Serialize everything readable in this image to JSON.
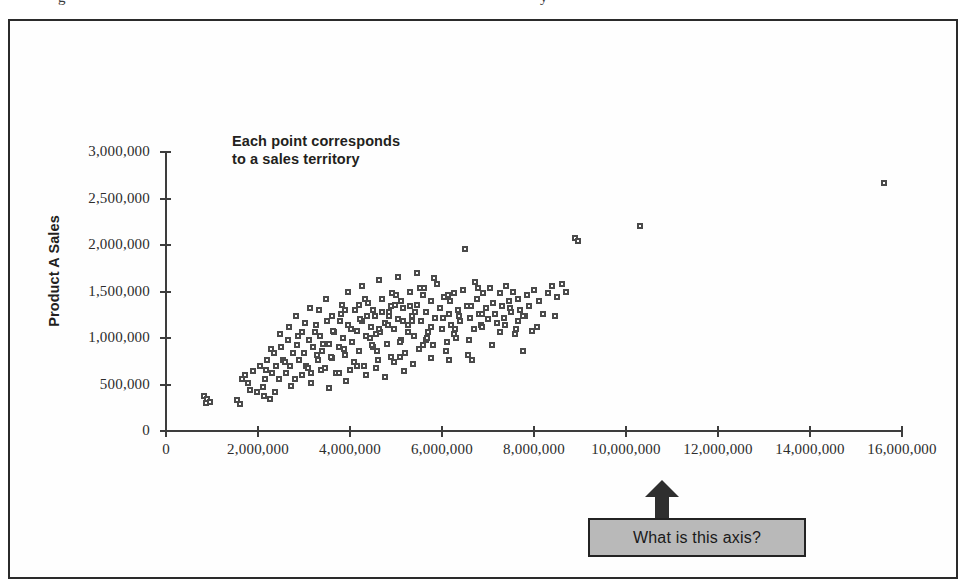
{
  "page": {
    "top_clipped_text_left": "g",
    "top_clipped_text_right": "y"
  },
  "figure": {
    "annotation": {
      "line1": "Each point corresponds",
      "line2": "to a sales territory"
    },
    "callout": {
      "label": "What is this axis?",
      "fill_color": "#b9b9b9",
      "border_color": "#232323",
      "arrow_color": "#2f2f2f"
    }
  },
  "chart_data": {
    "type": "scatter",
    "title": "",
    "xlabel": "",
    "ylabel": "Product A Sales",
    "xlim": [
      0,
      16000000
    ],
    "ylim": [
      0,
      3000000
    ],
    "grid": false,
    "legend": "none",
    "marker_color": "#4a4a4a",
    "annotations": [
      {
        "text": "Each point corresponds to a sales territory",
        "x": 2600000,
        "y": 2950000
      },
      {
        "text": "What is this axis?",
        "x": 11000000,
        "y": -450000
      }
    ],
    "xticks": [
      0,
      2000000,
      4000000,
      6000000,
      8000000,
      10000000,
      12000000,
      14000000,
      16000000
    ],
    "xticklabels": [
      "0",
      "2,000,000",
      "4,000,000",
      "6,000,000",
      "8,000,000",
      "10,000,000",
      "12,000,000",
      "14,000,000",
      "16,000,000"
    ],
    "yticks": [
      0,
      500000,
      1000000,
      1500000,
      2000000,
      2500000,
      3000000
    ],
    "yticklabels": [
      "0",
      "500,000",
      "1,000,000",
      "1,500,000",
      "2,000,000",
      "2,500,000",
      "3,000,000"
    ],
    "points": [
      [
        820000,
        380000
      ],
      [
        900000,
        345000
      ],
      [
        880000,
        300000
      ],
      [
        950000,
        310000
      ],
      [
        1550000,
        330000
      ],
      [
        1600000,
        290000
      ],
      [
        1650000,
        560000
      ],
      [
        1720000,
        600000
      ],
      [
        1780000,
        520000
      ],
      [
        1900000,
        640000
      ],
      [
        2050000,
        700000
      ],
      [
        2100000,
        470000
      ],
      [
        2150000,
        560000
      ],
      [
        2200000,
        760000
      ],
      [
        2300000,
        620000
      ],
      [
        2350000,
        840000
      ],
      [
        2400000,
        700000
      ],
      [
        2450000,
        560000
      ],
      [
        2500000,
        900000
      ],
      [
        2550000,
        760000
      ],
      [
        2600000,
        620000
      ],
      [
        2650000,
        980000
      ],
      [
        2700000,
        700000
      ],
      [
        2750000,
        840000
      ],
      [
        2800000,
        560000
      ],
      [
        2850000,
        920000
      ],
      [
        2900000,
        760000
      ],
      [
        2950000,
        1060000
      ],
      [
        3000000,
        840000
      ],
      [
        3050000,
        700000
      ],
      [
        3100000,
        980000
      ],
      [
        3150000,
        620000
      ],
      [
        3200000,
        900000
      ],
      [
        3250000,
        1140000
      ],
      [
        3300000,
        760000
      ],
      [
        3350000,
        1020000
      ],
      [
        3400000,
        860000
      ],
      [
        3450000,
        680000
      ],
      [
        3500000,
        1180000
      ],
      [
        3550000,
        940000
      ],
      [
        3600000,
        780000
      ],
      [
        3650000,
        1060000
      ],
      [
        3700000,
        620000
      ],
      [
        3750000,
        900000
      ],
      [
        3800000,
        1260000
      ],
      [
        3850000,
        1000000
      ],
      [
        3900000,
        820000
      ],
      [
        3950000,
        1140000
      ],
      [
        4000000,
        660000
      ],
      [
        4050000,
        960000
      ],
      [
        4100000,
        1300000
      ],
      [
        4150000,
        1080000
      ],
      [
        4200000,
        860000
      ],
      [
        4250000,
        1180000
      ],
      [
        4300000,
        700000
      ],
      [
        4350000,
        1020000
      ],
      [
        4400000,
        1380000
      ],
      [
        4450000,
        1120000
      ],
      [
        4500000,
        900000
      ],
      [
        4550000,
        1240000
      ],
      [
        4600000,
        760000
      ],
      [
        4650000,
        1060000
      ],
      [
        4700000,
        1420000
      ],
      [
        4750000,
        1160000
      ],
      [
        4800000,
        940000
      ],
      [
        4850000,
        1280000
      ],
      [
        4900000,
        800000
      ],
      [
        4950000,
        1100000
      ],
      [
        5000000,
        1460000
      ],
      [
        5050000,
        1200000
      ],
      [
        5100000,
        980000
      ],
      [
        5150000,
        1320000
      ],
      [
        5200000,
        840000
      ],
      [
        5250000,
        1140000
      ],
      [
        5300000,
        1500000
      ],
      [
        5350000,
        1240000
      ],
      [
        5400000,
        1020000
      ],
      [
        5450000,
        1360000
      ],
      [
        5500000,
        880000
      ],
      [
        5550000,
        1180000
      ],
      [
        5600000,
        1540000
      ],
      [
        5650000,
        1280000
      ],
      [
        5700000,
        1060000
      ],
      [
        5750000,
        1400000
      ],
      [
        5800000,
        920000
      ],
      [
        5850000,
        1220000
      ],
      [
        5900000,
        1580000
      ],
      [
        5950000,
        1320000
      ],
      [
        6000000,
        1100000
      ],
      [
        6050000,
        1440000
      ],
      [
        6100000,
        960000
      ],
      [
        6150000,
        1260000
      ],
      [
        6200000,
        1140000
      ],
      [
        6250000,
        1480000
      ],
      [
        6300000,
        1000000
      ],
      [
        6350000,
        1300000
      ],
      [
        6400000,
        1180000
      ],
      [
        6450000,
        1520000
      ],
      [
        6500000,
        1960000
      ],
      [
        6550000,
        1340000
      ],
      [
        6600000,
        1220000
      ],
      [
        6650000,
        760000
      ],
      [
        6700000,
        1100000
      ],
      [
        6750000,
        1420000
      ],
      [
        6800000,
        1260000
      ],
      [
        6850000,
        1140000
      ],
      [
        6900000,
        1480000
      ],
      [
        6950000,
        1320000
      ],
      [
        7000000,
        1200000
      ],
      [
        7050000,
        1540000
      ],
      [
        7100000,
        1380000
      ],
      [
        7150000,
        1260000
      ],
      [
        7200000,
        1160000
      ],
      [
        7250000,
        1480000
      ],
      [
        7300000,
        1340000
      ],
      [
        7350000,
        1220000
      ],
      [
        7400000,
        1560000
      ],
      [
        7450000,
        1400000
      ],
      [
        7500000,
        1280000
      ],
      [
        7550000,
        1500000
      ],
      [
        7600000,
        1100000
      ],
      [
        7650000,
        1420000
      ],
      [
        7700000,
        1300000
      ],
      [
        7750000,
        860000
      ],
      [
        7800000,
        1240000
      ],
      [
        7850000,
        1460000
      ],
      [
        7900000,
        1340000
      ],
      [
        7950000,
        1080000
      ],
      [
        8000000,
        1520000
      ],
      [
        8100000,
        1400000
      ],
      [
        8200000,
        1260000
      ],
      [
        8300000,
        1480000
      ],
      [
        8400000,
        1560000
      ],
      [
        8500000,
        1440000
      ],
      [
        8600000,
        1580000
      ],
      [
        8700000,
        1500000
      ],
      [
        8900000,
        2080000
      ],
      [
        8950000,
        2040000
      ],
      [
        10300000,
        2200000
      ],
      [
        15600000,
        2670000
      ],
      [
        3120000,
        1320000
      ],
      [
        3480000,
        1420000
      ],
      [
        3960000,
        1500000
      ],
      [
        4260000,
        1560000
      ],
      [
        4620000,
        1620000
      ],
      [
        5040000,
        1660000
      ],
      [
        5460000,
        1700000
      ],
      [
        5820000,
        1640000
      ],
      [
        2680000,
        1120000
      ],
      [
        3240000,
        1060000
      ],
      [
        3780000,
        1180000
      ],
      [
        4380000,
        1240000
      ],
      [
        4980000,
        1360000
      ],
      [
        5580000,
        1460000
      ],
      [
        6180000,
        1400000
      ],
      [
        6780000,
        1540000
      ],
      [
        2380000,
        420000
      ],
      [
        2720000,
        480000
      ],
      [
        3160000,
        520000
      ],
      [
        3540000,
        460000
      ],
      [
        3920000,
        540000
      ],
      [
        4340000,
        600000
      ],
      [
        4760000,
        580000
      ],
      [
        5180000,
        640000
      ],
      [
        2280000,
        880000
      ],
      [
        2880000,
        1020000
      ],
      [
        3420000,
        940000
      ],
      [
        4020000,
        1100000
      ],
      [
        4560000,
        1040000
      ],
      [
        5160000,
        1180000
      ],
      [
        5760000,
        1120000
      ],
      [
        6360000,
        1240000
      ],
      [
        2480000,
        1040000
      ],
      [
        3020000,
        1160000
      ],
      [
        3620000,
        1080000
      ],
      [
        4220000,
        1200000
      ],
      [
        4820000,
        1140000
      ],
      [
        5420000,
        1280000
      ],
      [
        6020000,
        1220000
      ],
      [
        6620000,
        1340000
      ],
      [
        2180000,
        660000
      ],
      [
        2580000,
        740000
      ],
      [
        3080000,
        680000
      ],
      [
        3580000,
        800000
      ],
      [
        4080000,
        740000
      ],
      [
        4580000,
        860000
      ],
      [
        5080000,
        800000
      ],
      [
        5580000,
        920000
      ],
      [
        6080000,
        860000
      ],
      [
        6580000,
        980000
      ],
      [
        7080000,
        920000
      ],
      [
        7580000,
        1040000
      ],
      [
        2820000,
        1240000
      ],
      [
        3320000,
        1300000
      ],
      [
        3820000,
        1360000
      ],
      [
        4320000,
        1420000
      ],
      [
        4920000,
        1480000
      ],
      [
        5520000,
        1540000
      ],
      [
        6120000,
        1460000
      ],
      [
        6720000,
        1600000
      ],
      [
        1980000,
        420000
      ],
      [
        2120000,
        380000
      ],
      [
        1820000,
        440000
      ],
      [
        2260000,
        340000
      ],
      [
        5260000,
        1060000
      ],
      [
        5660000,
        980000
      ],
      [
        6260000,
        1040000
      ],
      [
        6860000,
        1120000
      ],
      [
        7260000,
        1060000
      ],
      [
        7660000,
        1180000
      ],
      [
        8060000,
        1120000
      ],
      [
        8460000,
        1240000
      ],
      [
        4440000,
        1000000
      ],
      [
        4640000,
        1100000
      ],
      [
        4840000,
        1240000
      ],
      [
        5340000,
        1180000
      ],
      [
        3280000,
        820000
      ],
      [
        3880000,
        880000
      ],
      [
        4480000,
        920000
      ],
      [
        5080000,
        960000
      ],
      [
        5680000,
        1000000
      ],
      [
        6280000,
        1100000
      ],
      [
        6880000,
        1260000
      ],
      [
        7480000,
        1320000
      ],
      [
        2960000,
        600000
      ],
      [
        3360000,
        660000
      ],
      [
        3760000,
        620000
      ],
      [
        4160000,
        700000
      ],
      [
        4560000,
        680000
      ],
      [
        4960000,
        740000
      ],
      [
        5360000,
        720000
      ],
      [
        5760000,
        780000
      ],
      [
        6160000,
        760000
      ],
      [
        6560000,
        820000
      ],
      [
        7360000,
        1140000
      ],
      [
        7760000,
        1240000
      ],
      [
        4700000,
        1280000
      ],
      [
        4900000,
        1340000
      ],
      [
        5100000,
        1400000
      ],
      [
        5300000,
        1340000
      ],
      [
        3600000,
        1240000
      ],
      [
        3900000,
        1300000
      ],
      [
        4200000,
        1360000
      ],
      [
        4500000,
        1300000
      ]
    ]
  }
}
